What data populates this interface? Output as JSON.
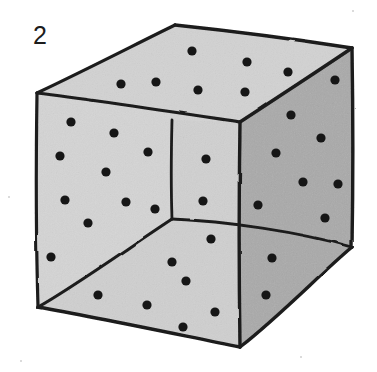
{
  "figure": {
    "label": "2",
    "caption_number": "2",
    "shape": "cube",
    "background_color": "#ffffff",
    "ink_color": "#1c1c1c",
    "dot_color": "#161616",
    "face_fill_light": "#d4d4d4",
    "face_fill_mid": "#c9c9c9",
    "face_fill_dark": "#a9a9a9",
    "canvas": {
      "width": 377,
      "height": 372
    }
  },
  "geometry": {
    "vertices": {
      "top_back": {
        "x": 175,
        "y": 25
      },
      "top_left": {
        "x": 37,
        "y": 93
      },
      "top_right": {
        "x": 352,
        "y": 48
      },
      "top_front": {
        "x": 240,
        "y": 122
      },
      "bottom_left": {
        "x": 38,
        "y": 307
      },
      "bottom_front": {
        "x": 240,
        "y": 347
      },
      "bottom_right": {
        "x": 352,
        "y": 247
      },
      "inner_bottom": {
        "x": 172,
        "y": 219
      },
      "inner_top": {
        "x": 172,
        "y": 120
      }
    },
    "edges": [
      {
        "name": "top-back-to-top-left",
        "from": "top_back",
        "to": "top_left"
      },
      {
        "name": "top-back-to-top-right",
        "from": "top_back",
        "to": "top_right"
      },
      {
        "name": "top-left-to-top-front",
        "from": "top_left",
        "to": "top_front"
      },
      {
        "name": "top-right-to-top-front",
        "from": "top_right",
        "to": "top_front"
      },
      {
        "name": "left-vertical",
        "from": "top_left",
        "to": "bottom_left"
      },
      {
        "name": "front-vertical",
        "from": "top_front",
        "to": "bottom_front"
      },
      {
        "name": "right-vertical",
        "from": "top_right",
        "to": "bottom_right"
      },
      {
        "name": "bottom-left-to-front",
        "from": "bottom_left",
        "to": "bottom_front"
      },
      {
        "name": "bottom-front-to-right",
        "from": "bottom_front",
        "to": "bottom_right"
      },
      {
        "name": "hidden-back-vertical",
        "from": "inner_top",
        "to": "inner_bottom"
      },
      {
        "name": "hidden-back-to-left",
        "from": "inner_bottom",
        "to": "bottom_left"
      },
      {
        "name": "hidden-back-to-right",
        "from": "inner_bottom",
        "to": "bottom_right"
      }
    ]
  },
  "dots": {
    "top_face": [
      {
        "x": 192,
        "y": 51
      },
      {
        "x": 247,
        "y": 62
      },
      {
        "x": 288,
        "y": 72
      },
      {
        "x": 121,
        "y": 84
      },
      {
        "x": 156,
        "y": 82
      },
      {
        "x": 198,
        "y": 90
      },
      {
        "x": 245,
        "y": 92
      },
      {
        "x": 335,
        "y": 80
      }
    ],
    "left_face": [
      {
        "x": 71,
        "y": 122
      },
      {
        "x": 114,
        "y": 133
      },
      {
        "x": 148,
        "y": 152
      },
      {
        "x": 60,
        "y": 156
      },
      {
        "x": 106,
        "y": 172
      },
      {
        "x": 65,
        "y": 200
      },
      {
        "x": 126,
        "y": 202
      },
      {
        "x": 155,
        "y": 209
      },
      {
        "x": 88,
        "y": 223
      },
      {
        "x": 51,
        "y": 257
      }
    ],
    "back_inner_face": [
      {
        "x": 206,
        "y": 159
      },
      {
        "x": 203,
        "y": 201
      }
    ],
    "right_face": [
      {
        "x": 291,
        "y": 115
      },
      {
        "x": 321,
        "y": 138
      },
      {
        "x": 276,
        "y": 153
      },
      {
        "x": 303,
        "y": 182
      },
      {
        "x": 338,
        "y": 184
      },
      {
        "x": 258,
        "y": 205
      },
      {
        "x": 325,
        "y": 218
      }
    ],
    "bottom_face": [
      {
        "x": 98,
        "y": 295
      },
      {
        "x": 147,
        "y": 305
      },
      {
        "x": 172,
        "y": 262
      },
      {
        "x": 211,
        "y": 239
      },
      {
        "x": 186,
        "y": 281
      },
      {
        "x": 215,
        "y": 312
      },
      {
        "x": 183,
        "y": 327
      },
      {
        "x": 272,
        "y": 258
      },
      {
        "x": 266,
        "y": 295
      }
    ]
  },
  "counts": {
    "top_face_dots": 8,
    "left_face_dots": 10,
    "back_inner_face_dots": 2,
    "right_face_dots": 7,
    "bottom_face_dots": 9,
    "total_dots": 36
  }
}
